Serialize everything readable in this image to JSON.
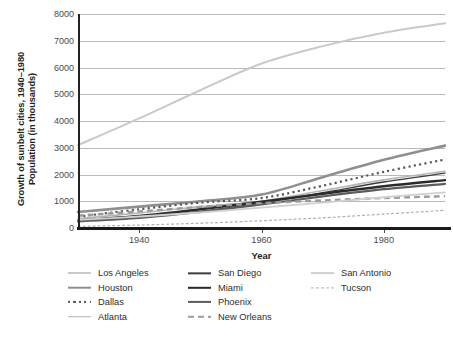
{
  "chart_data": {
    "type": "line",
    "title": "",
    "ylabel_line1": "Growth of sunbelt cities, 1940–1980",
    "ylabel_line2": "Population (in thousands)",
    "xlabel": "Year",
    "xlim": [
      1930,
      1990
    ],
    "ylim": [
      0,
      8000
    ],
    "xticks": [
      1940,
      1960,
      1980
    ],
    "yticks": [
      0,
      1000,
      2000,
      3000,
      4000,
      5000,
      6000,
      7000,
      8000
    ],
    "grid": true,
    "legend_position": "below",
    "x": [
      1930,
      1940,
      1950,
      1960,
      1970,
      1980,
      1990
    ],
    "series": [
      {
        "name": "Los Angeles",
        "color": "#c9c9c9",
        "width": 2.0,
        "dash": "solid",
        "values": [
          3100,
          4100,
          5150,
          6150,
          6800,
          7300,
          7650
        ]
      },
      {
        "name": "Houston",
        "color": "#8f8f8f",
        "width": 2.6,
        "dash": "solid",
        "values": [
          600,
          800,
          1000,
          1250,
          1900,
          2550,
          3080
        ]
      },
      {
        "name": "Dallas",
        "color": "#555555",
        "width": 2.2,
        "dash": "dotted",
        "values": [
          420,
          700,
          950,
          1120,
          1580,
          2100,
          2560
        ]
      },
      {
        "name": "Atlanta",
        "color": "#b5b5b5",
        "width": 1.6,
        "dash": "solid",
        "values": [
          350,
          560,
          800,
          1000,
          1400,
          1800,
          2120
        ]
      },
      {
        "name": "San Diego",
        "color": "#3c3c3c",
        "width": 1.3,
        "dash": "solid",
        "values": [
          270,
          400,
          620,
          940,
          1320,
          1720,
          2050
        ]
      },
      {
        "name": "Miami",
        "color": "#2a2a2a",
        "width": 2.4,
        "dash": "solid",
        "values": [
          280,
          450,
          700,
          980,
          1280,
          1560,
          1790
        ]
      },
      {
        "name": "Phoenix",
        "color": "#5c5c5c",
        "width": 2.2,
        "dash": "solid",
        "values": [
          250,
          380,
          600,
          880,
          1180,
          1450,
          1650
        ]
      },
      {
        "name": "New Orleans",
        "color": "#9a9a9a",
        "width": 2.4,
        "dash": "dashed",
        "values": [
          460,
          620,
          790,
          930,
          1030,
          1120,
          1190
        ]
      },
      {
        "name": "San Antonio",
        "color": "#cfcfcf",
        "width": 1.8,
        "dash": "solid",
        "values": [
          300,
          430,
          580,
          760,
          950,
          1150,
          1330
        ]
      },
      {
        "name": "Tucson",
        "color": "#b0b0b0",
        "width": 1.2,
        "dash": "dashed",
        "values": [
          60,
          110,
          180,
          270,
          380,
          520,
          660
        ]
      }
    ]
  },
  "legend": {
    "columns": [
      {
        "items": [
          "Los Angeles",
          "Houston",
          "Dallas",
          "Atlanta"
        ]
      },
      {
        "items": [
          "San Diego",
          "Miami",
          "Phoenix",
          "New Orleans"
        ]
      },
      {
        "items": [
          "San Antonio",
          "Tucson"
        ]
      }
    ]
  }
}
